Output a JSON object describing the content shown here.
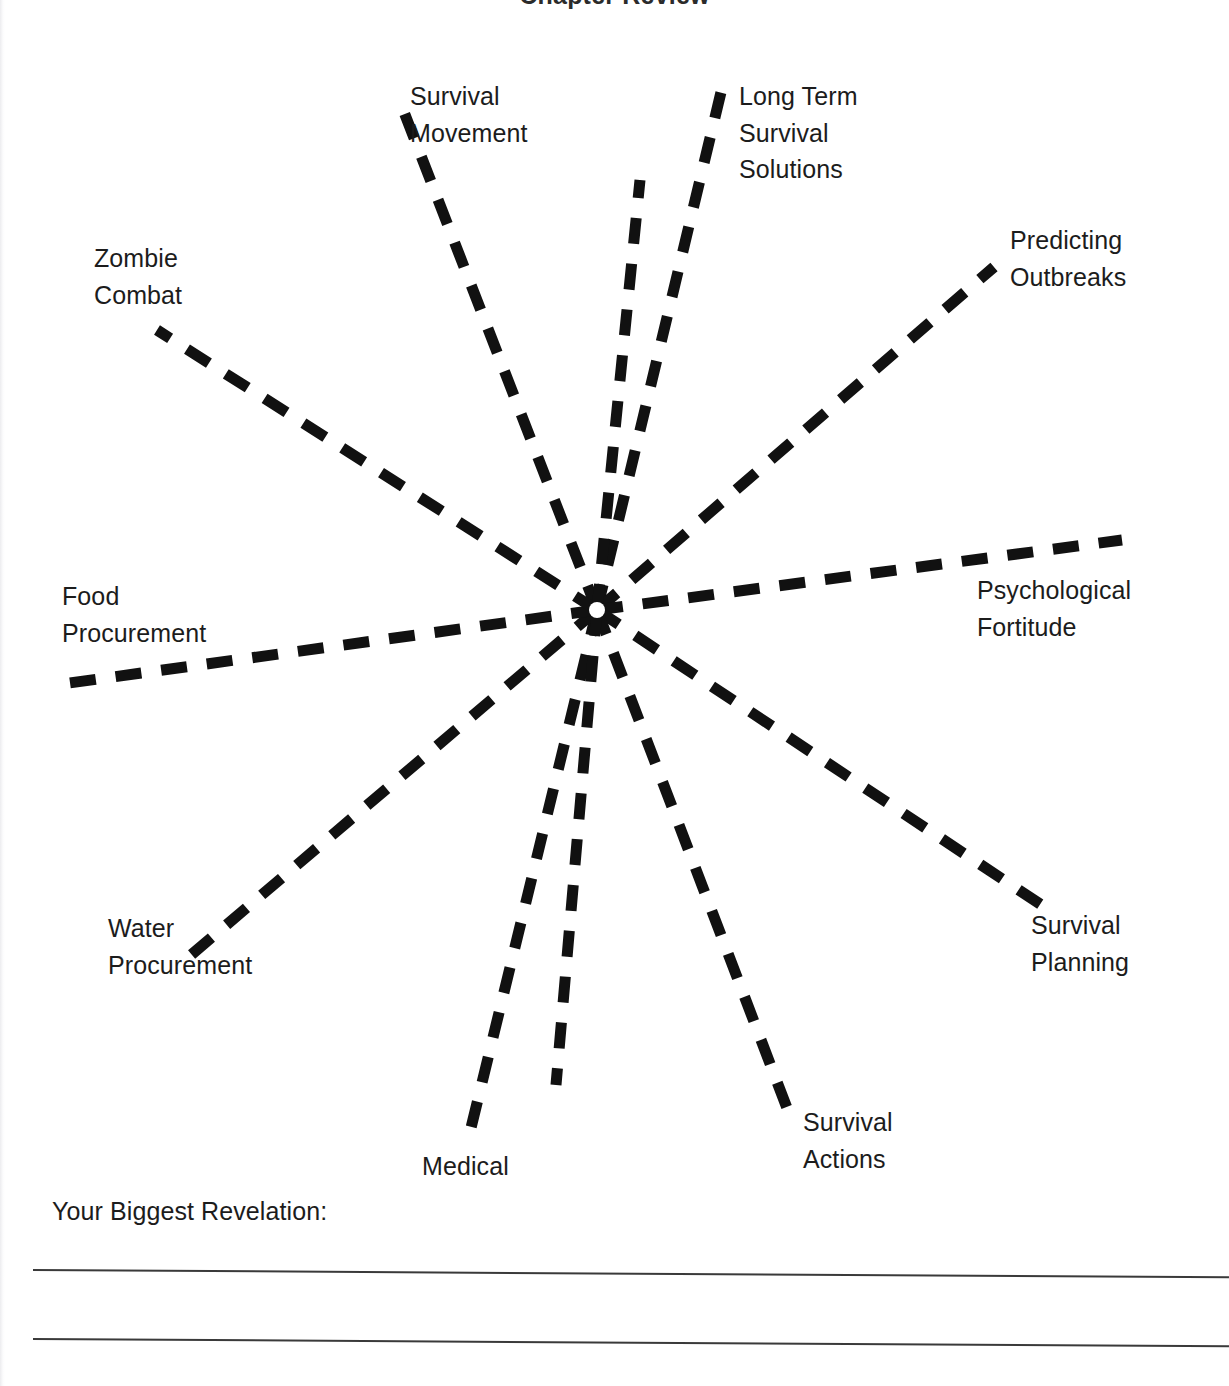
{
  "page": {
    "title": "Chapter Review",
    "background_color": "#ffffff",
    "ink_color": "#1a1a1a",
    "width": 1229,
    "height": 1386
  },
  "diagram": {
    "type": "spoke-diagram",
    "center": {
      "x": 597,
      "y": 610
    },
    "dash_color": "#111111",
    "dash_width": 11,
    "dash_pattern": "26 20",
    "spoke_count": 12,
    "labeled_spoke_count": 10,
    "spokes": [
      {
        "id": "survival-movement",
        "label": "Survival\nMovement",
        "angle_deg": -112,
        "end": {
          "x": 404,
          "y": 112
        },
        "label_pos": {
          "x": 410,
          "y": 78
        },
        "label_align": "l"
      },
      {
        "id": "long-term-survival-solutions",
        "label": "Long Term\nSurvival\nSolutions",
        "angle_deg": -96,
        "end": {
          "x": 722,
          "y": 88
        },
        "label_pos": {
          "x": 739,
          "y": 78
        },
        "label_align": "r"
      },
      {
        "id": "predicting-outbreaks",
        "label": "Predicting\nOutbreaks",
        "angle_deg": -41,
        "end": {
          "x": 994,
          "y": 267
        },
        "label_pos": {
          "x": 1010,
          "y": 222
        },
        "label_align": "r"
      },
      {
        "id": "psychological-fortitude",
        "label": "Psychological\nFortitude",
        "angle_deg": -4,
        "end": {
          "x": 1122,
          "y": 540
        },
        "label_pos": {
          "x": 977,
          "y": 572
        },
        "label_align": "r"
      },
      {
        "id": "survival-planning",
        "label": "Survival\nPlanning",
        "angle_deg": 34,
        "end": {
          "x": 1046,
          "y": 908
        },
        "label_pos": {
          "x": 1031,
          "y": 907
        },
        "label_align": "r"
      },
      {
        "id": "survival-actions",
        "label": "Survival\nActions",
        "angle_deg": 64,
        "end": {
          "x": 790,
          "y": 1116
        },
        "label_pos": {
          "x": 803,
          "y": 1104
        },
        "label_align": "r"
      },
      {
        "id": "medical",
        "label": "Medical",
        "angle_deg": 95,
        "end": {
          "x": 470,
          "y": 1132
        },
        "label_pos": {
          "x": 422,
          "y": 1148
        },
        "label_align": "l"
      },
      {
        "id": "water-procurement",
        "label": "Water\nProcurement",
        "angle_deg": 140,
        "end": {
          "x": 191,
          "y": 955
        },
        "label_pos": {
          "x": 108,
          "y": 910
        },
        "label_align": "l"
      },
      {
        "id": "food-procurement",
        "label": "Food\nProcurement",
        "angle_deg": 175,
        "end": {
          "x": 62,
          "y": 684
        },
        "label_pos": {
          "x": 62,
          "y": 578
        },
        "label_align": "l"
      },
      {
        "id": "zombie-combat",
        "label": "Zombie\nCombat",
        "angle_deg": -150,
        "end": {
          "x": 157,
          "y": 330
        },
        "label_pos": {
          "x": 94,
          "y": 240
        },
        "label_align": "l"
      },
      {
        "id": "unlabeled-upper",
        "label": "",
        "angle_deg": -77,
        "end": {
          "x": 640,
          "y": 180
        },
        "label_pos": null,
        "label_align": "r"
      },
      {
        "id": "unlabeled-lower",
        "label": "",
        "angle_deg": 106,
        "end": {
          "x": 556,
          "y": 1085
        },
        "label_pos": null,
        "label_align": "l"
      }
    ]
  },
  "revelation": {
    "prompt": "Your Biggest Revelation:",
    "line_count": 2,
    "lines": [
      "",
      ""
    ]
  }
}
